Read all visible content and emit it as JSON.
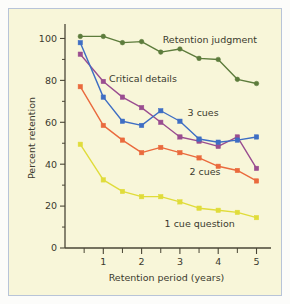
{
  "figure": {
    "background": "#f8f6d9",
    "border_color": "#b8c4d8",
    "axis_color": "#4a4636"
  },
  "chart_data": {
    "type": "line",
    "title": "",
    "xlabel": "Retention period (years)",
    "ylabel": "Percent retention",
    "xlim": [
      0,
      5.3
    ],
    "ylim": [
      0,
      105
    ],
    "grid": false,
    "legend": "inline-annotations",
    "x": [
      0.4,
      1,
      1.5,
      2,
      2.5,
      3,
      3.5,
      4,
      4.5,
      5
    ],
    "xticks_major": [
      1,
      2,
      3,
      4,
      5
    ],
    "xtick_labels": [
      "1",
      "2",
      "3",
      "4",
      "5"
    ],
    "xticks_minor": [
      0.5,
      1.5,
      2.5,
      3.5,
      4.5
    ],
    "yticks_major": [
      0,
      20,
      40,
      60,
      80,
      100
    ],
    "ytick_labels": [
      "0",
      "20",
      "40",
      "60",
      "80",
      "100"
    ],
    "yticks_minor": [
      10,
      30,
      50,
      70,
      90
    ],
    "series": [
      {
        "name": "Retention judgment",
        "color": "#5d7c3c",
        "marker": "circle",
        "label_x": 2.55,
        "label_y": 98,
        "values": [
          101,
          101,
          98,
          98.5,
          93.5,
          95,
          90.5,
          90,
          80.5,
          78.5
        ]
      },
      {
        "name": "Critical details",
        "color": "#9a4d90",
        "marker": "square",
        "label_x": 1.15,
        "label_y": 79,
        "values": [
          92.5,
          79.5,
          72,
          67,
          60,
          53,
          51,
          48.5,
          53,
          38
        ]
      },
      {
        "name": "3 cues",
        "color": "#3e6ec4",
        "marker": "square",
        "label_x": 3.2,
        "label_y": 63,
        "values": [
          98,
          72,
          60.5,
          58.5,
          65.5,
          60.5,
          52,
          50.5,
          51.5,
          53
        ]
      },
      {
        "name": "2 cues",
        "color": "#ea6a3d",
        "marker": "square",
        "label_x": 3.25,
        "label_y": 35,
        "values": [
          77,
          58.5,
          51.5,
          45.5,
          48,
          45.5,
          43,
          39,
          37,
          32
        ]
      },
      {
        "name": "1 cue question",
        "color": "#e0dc3a",
        "marker": "square",
        "label_x": 2.6,
        "label_y": 10,
        "values": [
          49.5,
          32.5,
          27,
          24.5,
          24.5,
          22,
          19,
          18,
          17,
          14.5
        ]
      }
    ]
  }
}
